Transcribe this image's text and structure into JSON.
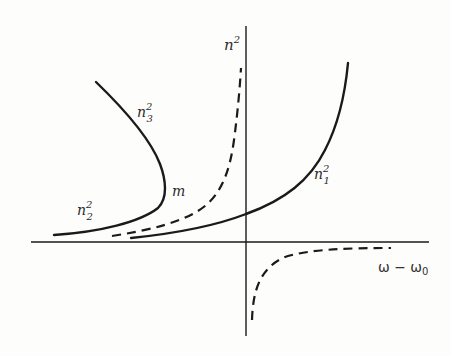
{
  "diagram": {
    "type": "dispersion-curves",
    "axes": {
      "y_label_base": "n",
      "y_label_sup": "2",
      "x_label": "ω − ω",
      "x_label_sub": "0"
    },
    "curves": [
      {
        "id": "n1",
        "style": "solid",
        "label_base": "n",
        "label_sup": "2",
        "label_sub": "1"
      },
      {
        "id": "n2",
        "style": "solid",
        "label_base": "n",
        "label_sup": "2",
        "label_sub": "2"
      },
      {
        "id": "n3",
        "style": "solid",
        "label_base": "n",
        "label_sup": "2",
        "label_sub": "3"
      },
      {
        "id": "dashed-upper",
        "style": "dashed"
      },
      {
        "id": "dashed-lower",
        "style": "dashed"
      }
    ],
    "point_label": "m",
    "colors": {
      "ink": "#1a1a1a",
      "background": "#fdfdfc"
    }
  }
}
